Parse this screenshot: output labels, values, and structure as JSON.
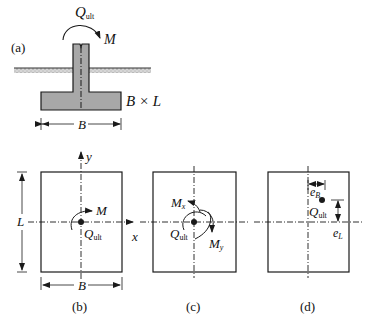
{
  "figure": {
    "panels": {
      "a": {
        "label": "(a)",
        "load_symbol": "Q",
        "load_sub": "ult",
        "moment_label": "M",
        "footing_label": "B × L",
        "width_label": "B"
      },
      "b": {
        "label": "(b)",
        "axis_x": "x",
        "axis_y": "y",
        "moment_label": "M",
        "load_symbol": "Q",
        "load_sub": "ult",
        "length_label": "L",
        "width_label": "B"
      },
      "c": {
        "label": "(c)",
        "moment_x_label": "M",
        "moment_x_sub": "x",
        "moment_y_label": "M",
        "moment_y_sub": "y",
        "load_symbol": "Q",
        "load_sub": "ult"
      },
      "d": {
        "label": "(d)",
        "ecc_b_label": "e",
        "ecc_b_sub": "B",
        "ecc_l_label": "e",
        "ecc_l_sub": "L",
        "load_symbol": "Q",
        "load_sub": "ult"
      }
    },
    "colors": {
      "concrete": "#a8a8a8",
      "line": "#1a1a1a",
      "soil": "#bdbdbd"
    }
  }
}
